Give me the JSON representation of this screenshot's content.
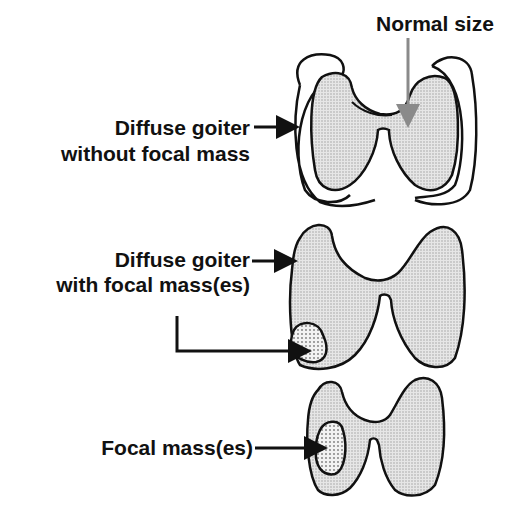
{
  "diagram": {
    "labels": {
      "normal_size": "Normal size",
      "diffuse_without_line1": "Diffuse goiter",
      "diffuse_without_line2": "without focal mass",
      "diffuse_with_line1": "Diffuse goiter",
      "diffuse_with_line2": "with focal mass(es)",
      "focal_masses": "Focal mass(es)"
    },
    "colors": {
      "outline": "#111111",
      "gland_fill": "#d9d9d9",
      "mass_fill": "#eeeeee",
      "normal_arrow": "#8a8a8a"
    }
  }
}
